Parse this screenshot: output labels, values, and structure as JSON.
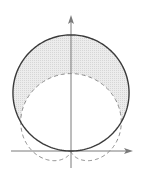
{
  "diagram": {
    "type": "polar-curves",
    "scale_a_px": 38.7,
    "origin_px": [
      71,
      151
    ],
    "curves": [
      {
        "name": "circle",
        "equation": "r = 3 sin(theta)",
        "style": "solid",
        "color": "#3a3a3a"
      },
      {
        "name": "cardioid",
        "equation": "r = 1 + sin(theta)",
        "style": "dashed",
        "color": "#8a8a8a"
      }
    ],
    "shaded_region": {
      "description": "inside circle, outside cardioid",
      "color": "#e4e4e4"
    },
    "axes": {
      "color": "#7a7a7a",
      "x_axis": {
        "from_px": 11,
        "to_px": 133
      },
      "y_axis": {
        "from_px": 168,
        "to_px": 15
      }
    },
    "intersections_theta": [
      "pi/6",
      "5pi/6"
    ]
  }
}
